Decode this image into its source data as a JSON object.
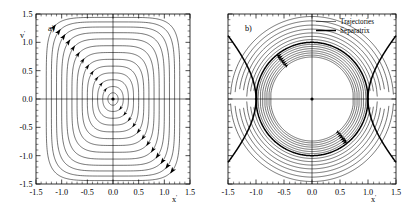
{
  "figure": {
    "background_color": "#ffffff",
    "line_color": "#000000",
    "panels": [
      {
        "id": "a",
        "label": "a)",
        "xlabel": "x'",
        "ylabel": "v'",
        "show_y_tick_labels": true
      },
      {
        "id": "b",
        "label": "b)",
        "xlabel": "x'",
        "ylabel": "",
        "show_y_tick_labels": false
      }
    ]
  },
  "legend": {
    "position": "top-right",
    "entries": [
      {
        "label": "Trajectories",
        "style": "thin-line"
      },
      {
        "label": "Separatrix",
        "style": "thick-line"
      }
    ]
  },
  "ticks": {
    "x": [
      "-1.5",
      "-1.0",
      "-0.5",
      "0.0",
      "0.5",
      "1.0",
      "1.5"
    ],
    "y": [
      "-1.5",
      "-1.0",
      "-0.5",
      "0.0",
      "0.5",
      "1.0",
      "1.5"
    ],
    "x_values": [
      -1.5,
      -1.0,
      -0.5,
      0.0,
      0.5,
      1.0,
      1.5
    ],
    "y_values": [
      -1.5,
      -1.0,
      -0.5,
      0.0,
      0.5,
      1.0,
      1.5
    ]
  },
  "chart_data": [
    {
      "type": "line",
      "title": "a)",
      "subtitle": "Phase-space portrait: nested closed orbits around a single elliptic fixed point at the origin",
      "xlabel": "x'",
      "ylabel": "v'",
      "xlim": [
        -1.5,
        1.5
      ],
      "ylim": [
        -1.5,
        1.5
      ],
      "grid": false,
      "legend": "none",
      "fixed_points": [
        {
          "x": 0.0,
          "y": 0.0,
          "kind": "elliptic-center"
        }
      ],
      "contour_levels": [
        0.12,
        0.24,
        0.36,
        0.48,
        0.6,
        0.72,
        0.84,
        0.96,
        1.08,
        1.18,
        1.26,
        1.33,
        1.39
      ],
      "series": [
        {
          "name": "closed orbit 1",
          "amplitude_x": 0.1,
          "amplitude_y": 0.11
        },
        {
          "name": "closed orbit 2",
          "amplitude_x": 0.2,
          "amplitude_y": 0.22
        },
        {
          "name": "closed orbit 3",
          "amplitude_x": 0.3,
          "amplitude_y": 0.34
        },
        {
          "name": "closed orbit 4",
          "amplitude_x": 0.4,
          "amplitude_y": 0.46
        },
        {
          "name": "closed orbit 5",
          "amplitude_x": 0.5,
          "amplitude_y": 0.58
        },
        {
          "name": "closed orbit 6",
          "amplitude_x": 0.6,
          "amplitude_y": 0.7
        },
        {
          "name": "closed orbit 7",
          "amplitude_x": 0.7,
          "amplitude_y": 0.82
        },
        {
          "name": "closed orbit 8",
          "amplitude_x": 0.8,
          "amplitude_y": 0.94
        },
        {
          "name": "closed orbit 9",
          "amplitude_x": 0.9,
          "amplitude_y": 1.06
        },
        {
          "name": "closed orbit 10",
          "amplitude_x": 1.0,
          "amplitude_y": 1.17
        },
        {
          "name": "closed orbit 11",
          "amplitude_x": 1.1,
          "amplitude_y": 1.27
        },
        {
          "name": "closed orbit 12",
          "amplitude_x": 1.2,
          "amplitude_y": 1.36
        },
        {
          "name": "closed orbit 13",
          "amplitude_x": 1.3,
          "amplitude_y": 1.44
        }
      ],
      "arrow_markers": {
        "direction": "clockwise",
        "count": 18,
        "description": "Filled triangular arrowheads along an upper-left to lower-right diagonal band indicating the flow direction"
      }
    },
    {
      "type": "line",
      "title": "b)",
      "subtitle": "Phase-space portrait with separatrix: elliptic point at origin and hyperbolic X-points at x' = -1 and x' = +1",
      "xlabel": "x'",
      "ylabel": "",
      "xlim": [
        -1.5,
        1.5
      ],
      "ylim": [
        -1.5,
        1.5
      ],
      "grid": false,
      "legend": "upper-right",
      "fixed_points": [
        {
          "x": 0.0,
          "y": 0.0,
          "kind": "elliptic-center"
        },
        {
          "x": -1.0,
          "y": 0.0,
          "kind": "hyperbolic-X-point"
        },
        {
          "x": 1.0,
          "y": 0.0,
          "kind": "hyperbolic-X-point"
        }
      ],
      "separatrix": {
        "name": "Separatrix",
        "level": 0.0,
        "description": "Cat's-eye separatrix joining the X-points at (-1, 0) and (+1, 0), plus the crossing branches that run to the plot edges"
      },
      "series": [
        {
          "name": "trapped orbit 1",
          "region": "inside-separatrix",
          "level": -0.45
        },
        {
          "name": "trapped orbit 2",
          "region": "inside-separatrix",
          "level": -0.4
        },
        {
          "name": "trapped orbit 3",
          "region": "inside-separatrix",
          "level": -0.34
        },
        {
          "name": "trapped orbit 4",
          "region": "inside-separatrix",
          "level": -0.28
        },
        {
          "name": "trapped orbit 5",
          "region": "inside-separatrix",
          "level": -0.21
        },
        {
          "name": "trapped orbit 6",
          "region": "inside-separatrix",
          "level": -0.14
        },
        {
          "name": "trapped orbit 7",
          "region": "inside-separatrix",
          "level": -0.07
        },
        {
          "name": "passing orbit above 1",
          "region": "outside-separatrix-upper",
          "level": 0.1
        },
        {
          "name": "passing orbit above 2",
          "region": "outside-separatrix-upper",
          "level": 0.22
        },
        {
          "name": "passing orbit above 3",
          "region": "outside-separatrix-upper",
          "level": 0.36
        },
        {
          "name": "passing orbit above 4",
          "region": "outside-separatrix-upper",
          "level": 0.52
        },
        {
          "name": "passing orbit above 5",
          "region": "outside-separatrix-upper",
          "level": 0.7
        },
        {
          "name": "passing orbit above 6",
          "region": "outside-separatrix-upper",
          "level": 0.9
        },
        {
          "name": "passing orbit above 7",
          "region": "outside-separatrix-upper",
          "level": 1.12
        },
        {
          "name": "passing orbit below 1",
          "region": "outside-separatrix-lower",
          "level": 0.1
        },
        {
          "name": "passing orbit below 2",
          "region": "outside-separatrix-lower",
          "level": 0.22
        },
        {
          "name": "passing orbit below 3",
          "region": "outside-separatrix-lower",
          "level": 0.36
        },
        {
          "name": "passing orbit below 4",
          "region": "outside-separatrix-lower",
          "level": 0.52
        },
        {
          "name": "passing orbit below 5",
          "region": "outside-separatrix-lower",
          "level": 0.7
        },
        {
          "name": "passing orbit below 6",
          "region": "outside-separatrix-lower",
          "level": 0.9
        },
        {
          "name": "passing orbit below 7",
          "region": "outside-separatrix-lower",
          "level": 1.12
        }
      ],
      "arrow_markers": {
        "direction": "clockwise",
        "count": 24,
        "description": "Filled triangular arrowheads on the inner trapped orbits along the upper-left to lower-right diagonal, plus arrowheads on the left and right outer branches"
      }
    }
  ]
}
